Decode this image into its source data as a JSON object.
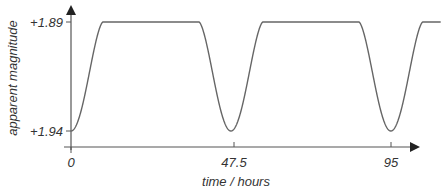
{
  "chart_data": {
    "type": "line",
    "title": "",
    "xlabel": "time / hours",
    "ylabel": "apparent magnitude",
    "x_ticks": [
      {
        "value": 0,
        "label": "0"
      },
      {
        "value": 47.5,
        "label": "47.5"
      },
      {
        "value": 95,
        "label": "95"
      }
    ],
    "y_ticks": [
      {
        "value": 1.89,
        "label": "+1.89"
      },
      {
        "value": 1.94,
        "label": "+1.94"
      }
    ],
    "xlim": [
      0,
      110
    ],
    "ylim": [
      1.94,
      1.89
    ],
    "y_inverted": true,
    "grid": false,
    "legend": null,
    "series": [
      {
        "name": "light curve",
        "description": "Periodic eclipsing light curve: flat at +1.89 with dips to +1.94 at t=0, 47.5 and 95 hours",
        "period_hours": 47.5,
        "eclipse_minima_hours": [
          0,
          47.5,
          95
        ],
        "eclipse_half_width_hours": 9.5,
        "max_magnitude": 1.94,
        "plateau_magnitude": 1.89,
        "x": [
          0,
          2,
          4,
          6,
          8,
          9.5,
          12,
          20,
          30,
          38,
          40,
          42,
          44,
          46,
          47.5,
          49,
          51,
          53,
          55,
          57,
          60,
          70,
          80,
          85.5,
          87.5,
          89.5,
          91.5,
          93.5,
          95,
          96.5,
          98.5,
          100.5,
          102.5,
          104.5,
          110
        ],
        "values": [
          1.94,
          1.935,
          1.92,
          1.9,
          1.892,
          1.89,
          1.89,
          1.89,
          1.89,
          1.89,
          1.892,
          1.9,
          1.92,
          1.935,
          1.94,
          1.935,
          1.92,
          1.9,
          1.892,
          1.89,
          1.89,
          1.89,
          1.89,
          1.89,
          1.892,
          1.9,
          1.92,
          1.935,
          1.94,
          1.935,
          1.92,
          1.9,
          1.892,
          1.89,
          1.89
        ]
      }
    ]
  },
  "layout": {
    "origin_x_px": 71,
    "x_axis_y_px": 147,
    "x_axis_end_px": 420,
    "y_axis_top_px": 5,
    "x_px_per_unit": 3.367,
    "y_top_value_px": 22,
    "y_bottom_value_px": 131,
    "line_color": "#666666",
    "axis_color": "#555555",
    "text_color": "#333333"
  }
}
